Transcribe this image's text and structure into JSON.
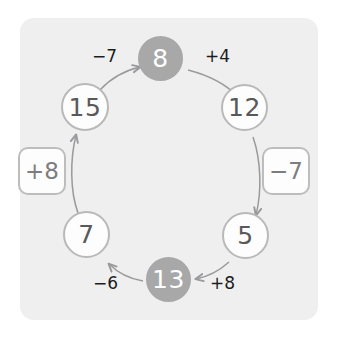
{
  "diagram": {
    "background_color": "#ffffff",
    "panel_color": "#efeff0",
    "filled_node_color": "#a8a8a8",
    "open_node_border_color": "#b9b9b9",
    "open_node_text_color": "#59595b",
    "filled_node_text_color": "#ffffff",
    "arrow_color": "#9a9a9c",
    "op_text_color": "#1c1c1c",
    "opbox_text_color": "#7d7d7f",
    "nodes": [
      {
        "id": "node-8",
        "value": "8",
        "style": "filled",
        "position": "top"
      },
      {
        "id": "node-12",
        "value": "12",
        "style": "open",
        "position": "upper-right"
      },
      {
        "id": "node-5",
        "value": "5",
        "style": "open",
        "position": "lower-right"
      },
      {
        "id": "node-13",
        "value": "13",
        "style": "filled",
        "position": "bottom"
      },
      {
        "id": "node-7",
        "value": "7",
        "style": "open",
        "position": "lower-left"
      },
      {
        "id": "node-15",
        "value": "15",
        "style": "open",
        "position": "upper-left"
      }
    ],
    "arrow_labels": [
      {
        "id": "op-plus-4",
        "text": "+4",
        "from": "node-8",
        "to": "node-12",
        "boxed": false
      },
      {
        "id": "op-minus-7-right",
        "text": "−7",
        "from": "node-12",
        "to": "node-5",
        "boxed": true
      },
      {
        "id": "op-plus-8-bottom",
        "text": "+8",
        "from": "node-5",
        "to": "node-13",
        "boxed": false
      },
      {
        "id": "op-minus-6",
        "text": "−6",
        "from": "node-13",
        "to": "node-7",
        "boxed": false
      },
      {
        "id": "op-plus-8-left",
        "text": "+8",
        "from": "node-7",
        "to": "node-15",
        "boxed": true
      },
      {
        "id": "op-minus-7-top",
        "text": "−7",
        "from": "node-15",
        "to": "node-8",
        "boxed": false
      }
    ]
  }
}
